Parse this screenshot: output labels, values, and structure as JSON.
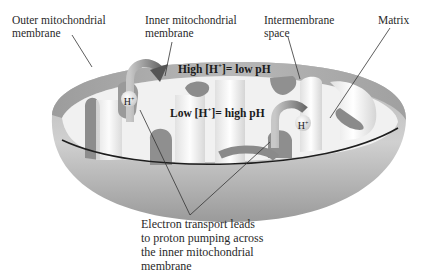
{
  "labels": {
    "outer_membrane": "Outer mitochondrial\nmembrane",
    "inner_membrane": "Inner mitochondrial\nmembrane",
    "intermembrane_space": "Intermembrane\nspace",
    "matrix": "Matrix"
  },
  "regions": {
    "high_h_prefix": "High [H",
    "high_h_suffix": "]= low pH",
    "low_h_prefix": "Low [H",
    "low_h_suffix": "]= high pH",
    "plus": "+"
  },
  "ions": {
    "left": "H",
    "right": "H",
    "charge": "+"
  },
  "caption": "Electron transport leads\nto proton pumping across\nthe inner mitochondrial\nmembrane",
  "colors": {
    "membrane_dark": "#8a8a8a",
    "membrane_light": "#d8d8d8",
    "interior": "#f2f2f2",
    "leader_line": "#333333"
  }
}
